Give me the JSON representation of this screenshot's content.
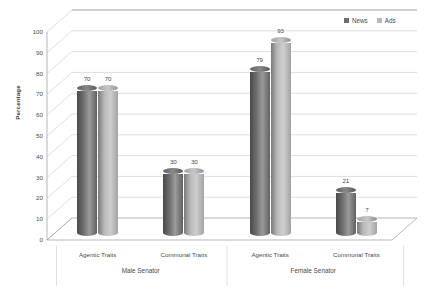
{
  "chart_data": {
    "type": "bar",
    "title": "",
    "xlabel": "",
    "ylabel": "Percentage",
    "ylim": [
      0,
      100
    ],
    "ytick_step": 10,
    "yticks": [
      "100",
      "90",
      "80",
      "70",
      "60",
      "50",
      "40",
      "30",
      "20",
      "10",
      "0"
    ],
    "grid": true,
    "style": "3d-cylinder",
    "legend_position": "top-right",
    "group_labels": [
      "Male Senator",
      "Female Senator"
    ],
    "categories": [
      "Agentic Traits",
      "Communal Traits",
      "Agentic Traits",
      "Communal Traits"
    ],
    "category_groups": [
      "Male Senator",
      "Male Senator",
      "Female Senator",
      "Female Senator"
    ],
    "series": [
      {
        "name": "News",
        "color": "#6e6e6e",
        "values": [
          70,
          30,
          79,
          21
        ]
      },
      {
        "name": "Ads",
        "color": "#b9b9b9",
        "values": [
          70,
          30,
          93,
          7
        ]
      }
    ]
  },
  "legend": {
    "entries": [
      {
        "label": "News",
        "color": "#6e6e6e"
      },
      {
        "label": "Ads",
        "color": "#b9b9b9"
      }
    ]
  },
  "axes": {
    "y_title": "Percentage"
  }
}
